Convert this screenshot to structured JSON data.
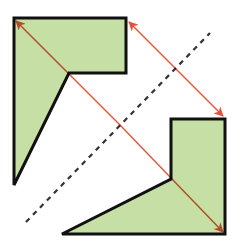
{
  "diagram": {
    "colors": {
      "fill": "#c6dfa4",
      "outline": "#111111",
      "arrow": "#e2553a",
      "axis": "#333333",
      "background": "#ffffff"
    },
    "shapes": [
      {
        "name": "original-shape",
        "points": [
          [
            14,
            18
          ],
          [
            126,
            18
          ],
          [
            126,
            73
          ],
          [
            69,
            73
          ],
          [
            14,
            185
          ]
        ]
      },
      {
        "name": "reflected-shape",
        "points": [
          [
            225,
            234
          ],
          [
            62,
            234
          ],
          [
            171,
            179
          ],
          [
            171,
            119
          ],
          [
            225,
            119
          ]
        ]
      }
    ],
    "axis_of_symmetry": {
      "from": [
        26,
        222
      ],
      "to": [
        210,
        33
      ],
      "style": "dashed"
    },
    "arrows": [
      {
        "name": "arrow-a-to-axis",
        "from": [
          120,
          125
        ],
        "to": [
          16,
          21
        ]
      },
      {
        "name": "arrow-axis-to-a-image",
        "from": [
          120,
          125
        ],
        "to": [
          223,
          232
        ]
      },
      {
        "name": "arrow-b-to-axis",
        "from": [
          176,
          69
        ],
        "to": [
          129,
          22
        ]
      },
      {
        "name": "arrow-axis-to-b-image",
        "from": [
          176,
          69
        ],
        "to": [
          223,
          116
        ]
      }
    ]
  }
}
